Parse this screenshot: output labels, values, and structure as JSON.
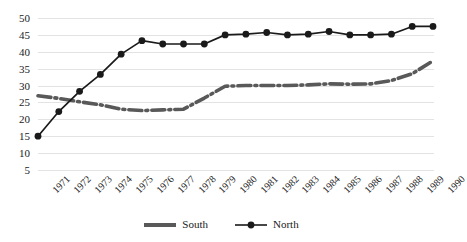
{
  "chart_data": {
    "type": "line",
    "title": "",
    "xlabel": "",
    "ylabel": "",
    "x": [
      "1971",
      "1972",
      "1973",
      "1974",
      "1975",
      "1976",
      "1977",
      "1978",
      "1979",
      "1980",
      "1981",
      "1982",
      "1983",
      "1984",
      "1985",
      "1986",
      "1987",
      "1988",
      "1989",
      "1990"
    ],
    "ylim": [
      5,
      50
    ],
    "yticks": [
      5,
      10,
      15,
      20,
      25,
      30,
      35,
      40,
      45,
      50
    ],
    "ytick_labels": [
      "5",
      "10",
      "15",
      "20",
      "25",
      "30",
      "35",
      "40",
      "45",
      "50"
    ],
    "grid": true,
    "legend_position": "bottom-center",
    "series": [
      {
        "name": "South",
        "color": "#595959",
        "style": "dash-dot",
        "marker": "none",
        "values": [
          27.0,
          26.2,
          25.2,
          24.3,
          23.0,
          22.6,
          22.8,
          23.0,
          26.3,
          29.8,
          30.0,
          30.0,
          30.0,
          30.2,
          30.5,
          30.4,
          30.5,
          31.5,
          33.5,
          37.3
        ]
      },
      {
        "name": "North",
        "color": "#1a1a1a",
        "style": "solid",
        "marker": "circle",
        "values": [
          15.0,
          22.3,
          28.3,
          33.3,
          39.3,
          43.3,
          42.3,
          42.3,
          42.3,
          45.0,
          45.2,
          45.7,
          45.0,
          45.2,
          46.0,
          45.0,
          45.0,
          45.2,
          47.5,
          47.5
        ]
      }
    ]
  },
  "legend": {
    "items": [
      {
        "label": "South"
      },
      {
        "label": "North"
      }
    ]
  },
  "colors": {
    "south": "#595959",
    "north": "#1a1a1a",
    "grid": "#e3e3e3",
    "background": "#ffffff"
  }
}
